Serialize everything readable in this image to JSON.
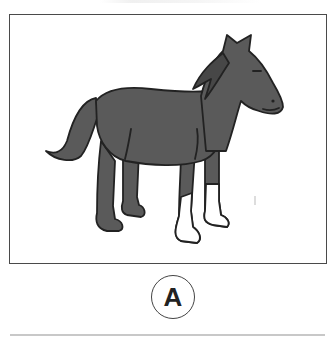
{
  "figure": {
    "label": "A",
    "colors": {
      "horse_fill": "#5a5a5a",
      "outline": "#222222",
      "socks": "#ffffff",
      "frame_border": "#4a4a4a"
    }
  }
}
